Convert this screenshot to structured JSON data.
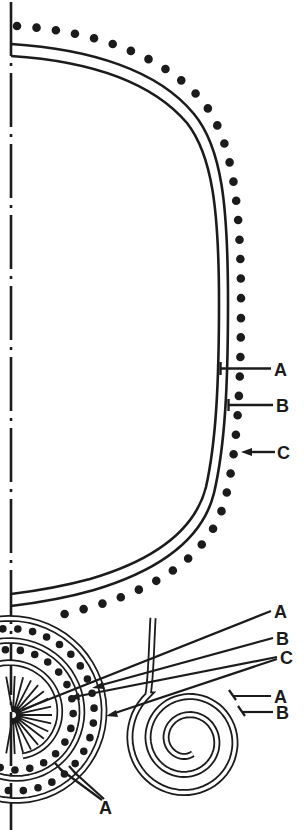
{
  "figure": {
    "background": "#ffffff",
    "ink": "#1b1b1b"
  },
  "annotations": {
    "envelope": [
      {
        "label": "A",
        "target": "inner-wall-line"
      },
      {
        "label": "B",
        "target": "outer-wall-line"
      },
      {
        "label": "C",
        "target": "dot-layer"
      }
    ],
    "roll": [
      {
        "label": "A",
        "target": "roll-hub"
      },
      {
        "label": "B",
        "target": "roll-dot-layer"
      },
      {
        "label": "C",
        "target": "roll-dot-layers"
      }
    ],
    "spiral_detail": [
      {
        "label": "A",
        "target": "spiral-outer-film"
      },
      {
        "label": "B",
        "target": "spiral-inner-film"
      }
    ],
    "roll_edge": [
      {
        "label": "A",
        "target": "roll-outer-turns"
      }
    ]
  }
}
